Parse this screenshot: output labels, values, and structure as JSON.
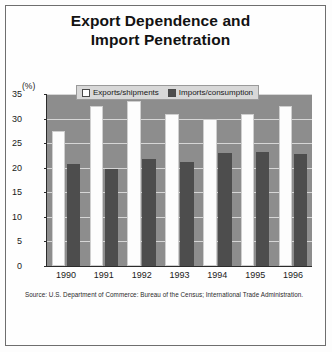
{
  "figure": {
    "title_line1": "Export Dependence and",
    "title_line2": "Import Penetration",
    "axis_unit": "(%)",
    "source": "Source: U.S. Department of Commerce: Bureau of the Census; International Trade Administration."
  },
  "legend": {
    "items": [
      {
        "label": "Exports/shipments",
        "swatch": "white",
        "color": "#ffffff"
      },
      {
        "label": "Imports/consumption",
        "swatch": "dark",
        "color": "#4d4d4d"
      }
    ]
  },
  "chart_data": {
    "type": "bar",
    "title": "Export Dependence and Import Penetration",
    "xlabel": "",
    "ylabel": "(%)",
    "ylim": [
      0,
      35
    ],
    "yticks": [
      0,
      5,
      10,
      15,
      20,
      25,
      30,
      35
    ],
    "ytick_labels": [
      "0",
      "5",
      "10",
      "15",
      "20",
      "25",
      "30",
      "35"
    ],
    "grid": true,
    "legend_position": "top-center",
    "categories": [
      "1990",
      "1991",
      "1992",
      "1993",
      "1994",
      "1995",
      "1996"
    ],
    "series": [
      {
        "name": "Exports/shipments",
        "color": "#ffffff",
        "values": [
          27.5,
          32.5,
          33.5,
          31.0,
          30.0,
          31.0,
          32.5
        ]
      },
      {
        "name": "Imports/consumption",
        "color": "#4d4d4d",
        "values": [
          20.7,
          19.8,
          21.7,
          21.2,
          23.0,
          23.3,
          22.8
        ]
      }
    ],
    "source": "Source: U.S. Department of Commerce: Bureau of the Census; International Trade Administration."
  }
}
